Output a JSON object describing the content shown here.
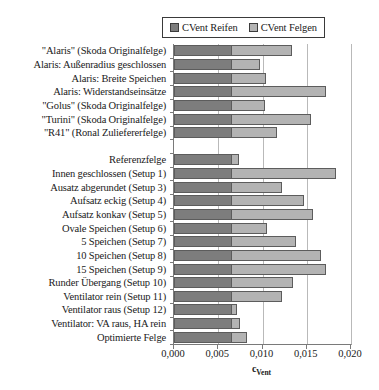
{
  "chart_data": {
    "type": "bar",
    "orientation": "horizontal",
    "stacked": true,
    "title": "",
    "xlabel": "c_Vent",
    "xlabel_base": "c",
    "xlabel_sub": "Vent",
    "ylabel": "",
    "xlim": [
      0.0,
      0.02
    ],
    "xticks": [
      0.0,
      0.005,
      0.01,
      0.015,
      0.02
    ],
    "xticklabels": [
      "0,000",
      "0,005",
      "0,010",
      "0,015",
      "0,020"
    ],
    "grid": "vertical",
    "legend_position": "top-right",
    "legend": [
      {
        "name": "CVent Reifen",
        "color": "#7d7d7d"
      },
      {
        "name": "CVent Felgen",
        "color": "#b3b3b3"
      }
    ],
    "series": [
      {
        "name": "CVent Reifen",
        "color": "#7d7d7d",
        "values": [
          0.0065,
          0.0065,
          0.0065,
          0.0065,
          0.0065,
          0.0065,
          0.0065,
          null,
          0.0065,
          0.0065,
          0.0065,
          0.0065,
          0.0065,
          0.0065,
          0.0065,
          0.0065,
          0.0065,
          0.0065,
          0.0065,
          0.0065,
          0.0065,
          0.0065
        ]
      },
      {
        "name": "CVent Felgen",
        "color": "#b3b3b3",
        "values": [
          0.0068,
          0.0032,
          0.0039,
          0.0107,
          0.0038,
          0.009,
          0.0051,
          null,
          0.0009,
          0.0118,
          0.0057,
          0.0082,
          0.0092,
          0.004,
          0.0073,
          0.0101,
          0.0107,
          0.0069,
          0.0057,
          0.0006,
          0.001,
          0.0018
        ]
      }
    ],
    "categories": [
      "\"Alaris\" (Skoda Originalfelge)",
      "Alaris: Außenradius geschlossen",
      "Alaris: Breite Speichen",
      "Alaris: Widerstandseinsätze",
      "\"Golus\" (Skoda Originalfelge)",
      "\"Turini\" (Skoda Originalfelge)",
      "\"R41\" (Ronal Zuliefererfelge)",
      "",
      "Referenzfelge",
      "Innen geschlossen (Setup 1)",
      "Ausatz abgerundet (Setup 3)",
      "Aufsatz eckig (Setup 4)",
      "Aufsatz konkav (Setup 5)",
      "Ovale Speichen (Setup 6)",
      "5 Speichen (Setup 7)",
      "10 Speichen (Setup 8)",
      "15 Speichen (Setup 9)",
      "Runder Übergang (Setup 10)",
      "Ventilator rein (Setup 11)",
      "Ventilator raus (Setup 12)",
      "Ventilator: VA raus, HA rein",
      "Optimierte Felge"
    ],
    "totals": [
      0.0133,
      0.0097,
      0.0104,
      0.0172,
      0.0103,
      0.0155,
      0.0116,
      null,
      0.0074,
      0.0183,
      0.0122,
      0.0147,
      0.0157,
      0.0105,
      0.0138,
      0.0166,
      0.0172,
      0.0134,
      0.0122,
      0.0071,
      0.0075,
      0.0083
    ]
  }
}
